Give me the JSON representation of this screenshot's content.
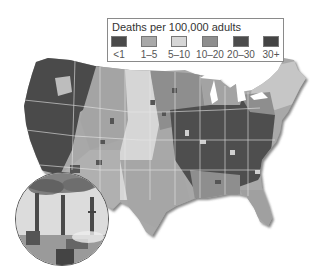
{
  "legend": {
    "title": "Deaths per 100,000 adults",
    "items": [
      {
        "label": "<1",
        "color": "#4a4a4a"
      },
      {
        "label": "1–5",
        "color": "#a9a9a9"
      },
      {
        "label": "5–10",
        "color": "#d6d6d6"
      },
      {
        "label": "10–20",
        "color": "#8e8e8e"
      },
      {
        "label": "20–30",
        "color": "#4c4c4c"
      },
      {
        "label": "30+",
        "color": "#444444"
      }
    ]
  },
  "map": {
    "subject": "United States contiguous states choropleth",
    "inset_image": "smokestacks-photo"
  }
}
